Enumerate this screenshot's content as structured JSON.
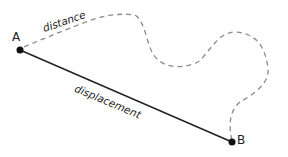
{
  "diagram": {
    "points": [
      {
        "id": "A",
        "label": "A",
        "x": 20,
        "y": 50
      },
      {
        "id": "B",
        "label": "B",
        "x": 232,
        "y": 142
      }
    ],
    "paths": [
      {
        "id": "distance",
        "label": "distance",
        "style": "dashed",
        "color": "#888888"
      },
      {
        "id": "displacement",
        "label": "displacement",
        "style": "solid",
        "color": "#222222",
        "from": "A",
        "to": "B"
      }
    ]
  },
  "labels": {
    "point_a": "A",
    "point_b": "B",
    "distance": "distance",
    "displacement": "displacement"
  },
  "colors": {
    "background": "#ffffff",
    "solid_line": "#222222",
    "dashed_line": "#888888",
    "point": "#111111"
  }
}
